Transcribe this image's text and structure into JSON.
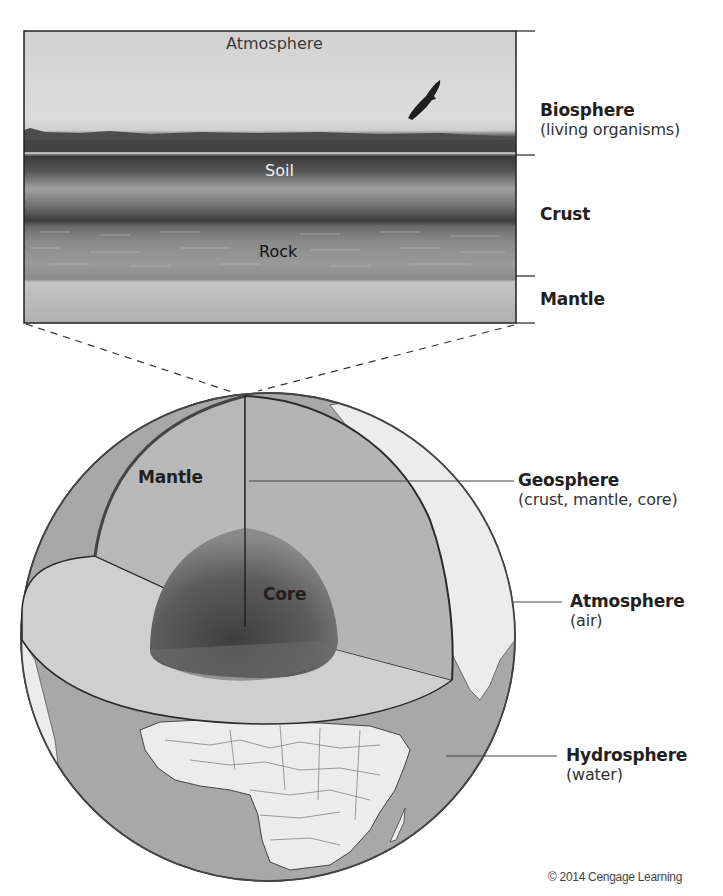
{
  "figure": {
    "colors": {
      "sky": "#d7d7d7",
      "treeline": "#4a4a4a",
      "soil_dark": "#3e3e3e",
      "soil_light": "#9a9a9a",
      "rock": "#8d8d8d",
      "mantle_band": "#b8b8b8",
      "mantle_section": "#b5b5b5",
      "core": "#5a5a5a",
      "ocean": "#a9a9a9",
      "land": "#eaeaea",
      "outline": "#2b2b2b"
    }
  },
  "inset": {
    "labels": {
      "atmosphere": "Atmosphere",
      "soil": "Soil",
      "rock": "Rock"
    }
  },
  "inset_brackets": [
    {
      "title": "Biosphere",
      "subtitle": "(living organisms)"
    },
    {
      "title": "Crust",
      "subtitle": ""
    },
    {
      "title": "Mantle",
      "subtitle": ""
    }
  ],
  "globe": {
    "inner_labels": {
      "mantle": "Mantle",
      "core": "Core"
    },
    "callouts": [
      {
        "title": "Geosphere",
        "subtitle": "(crust, mantle, core)"
      },
      {
        "title": "Atmosphere",
        "subtitle": "(air)"
      },
      {
        "title": "Hydrosphere",
        "subtitle": "(water)"
      }
    ]
  },
  "credit": "© 2014 Cengage Learning"
}
